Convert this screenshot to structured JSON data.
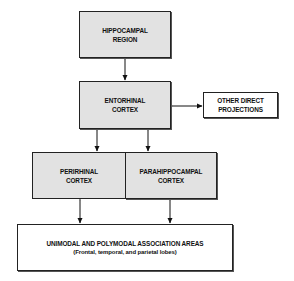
{
  "diagram": {
    "nodes": [
      {
        "id": "hippocampal",
        "lines": [
          "HIPPOCAMPAL",
          "REGION"
        ],
        "shaded": true
      },
      {
        "id": "entorhinal",
        "lines": [
          "ENTORHINAL",
          "CORTEX"
        ],
        "shaded": true
      },
      {
        "id": "other",
        "lines": [
          "OTHER DIRECT",
          "PROJECTIONS"
        ],
        "shaded": false
      },
      {
        "id": "perirhinal",
        "lines": [
          "PERIRHINAL",
          "CORTEX"
        ],
        "shaded": true
      },
      {
        "id": "parahippocampal",
        "lines": [
          "PARAHIPPOCAMPAL",
          "CORTEX"
        ],
        "shaded": true
      },
      {
        "id": "association",
        "lines": [
          "UNIMODAL AND POLYMODAL ASSOCIATION AREAS",
          "(Frontal, temporal, and parietal lobes)"
        ],
        "shaded": false
      }
    ],
    "edges": [
      {
        "from": "hippocampal",
        "to": "entorhinal",
        "type": "bidirectional"
      },
      {
        "from": "entorhinal",
        "to": "other",
        "type": "bidirectional"
      },
      {
        "from": "entorhinal",
        "to": "perirhinal",
        "type": "bidirectional"
      },
      {
        "from": "entorhinal",
        "to": "parahippocampal",
        "type": "bidirectional"
      },
      {
        "from": "perirhinal",
        "to": "association",
        "type": "bidirectional"
      },
      {
        "from": "parahippocampal",
        "to": "association",
        "type": "bidirectional"
      }
    ]
  }
}
